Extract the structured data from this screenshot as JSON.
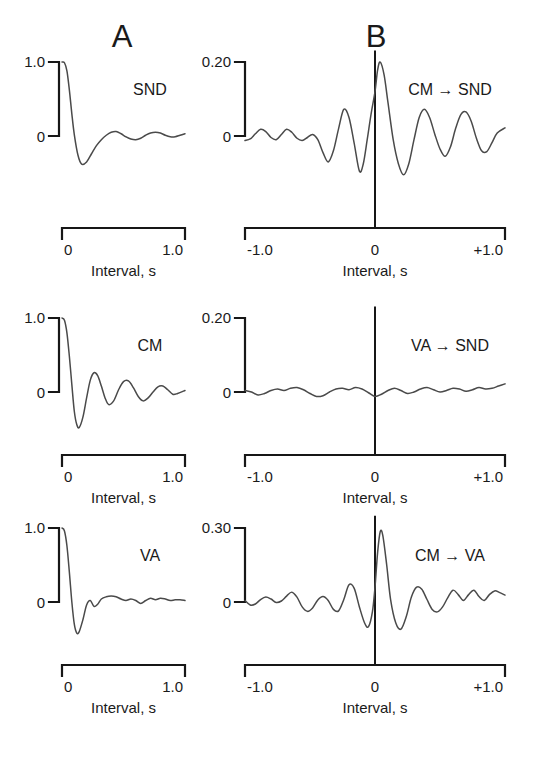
{
  "figure": {
    "panel_letters": [
      {
        "label": "A",
        "x": 122,
        "y": 47
      },
      {
        "label": "B",
        "x": 376,
        "y": 47
      }
    ]
  },
  "chart_data": [
    {
      "id": "snd-auto",
      "type": "line",
      "title": "",
      "series_label": "SND",
      "column": "A",
      "row": 0,
      "xlabel": "Interval, s",
      "ylabel": "",
      "xticks": [
        "0",
        "1.0"
      ],
      "xlim": [
        0,
        1.0
      ],
      "yticks": [
        "0",
        "1.0"
      ],
      "ylim": [
        -0.45,
        1.0
      ],
      "grid": false,
      "x": [
        0.0,
        0.02,
        0.04,
        0.06,
        0.08,
        0.1,
        0.13,
        0.16,
        0.2,
        0.24,
        0.28,
        0.32,
        0.36,
        0.4,
        0.44,
        0.48,
        0.52,
        0.56,
        0.6,
        0.64,
        0.68,
        0.72,
        0.76,
        0.8,
        0.84,
        0.88,
        0.92,
        0.96,
        1.0
      ],
      "y": [
        1.0,
        0.99,
        0.88,
        0.62,
        0.3,
        0.02,
        -0.26,
        -0.38,
        -0.35,
        -0.24,
        -0.13,
        -0.05,
        0.01,
        0.05,
        0.06,
        0.03,
        -0.01,
        -0.04,
        -0.05,
        -0.03,
        0.01,
        0.04,
        0.05,
        0.04,
        0.01,
        -0.01,
        -0.01,
        0.01,
        0.03
      ]
    },
    {
      "id": "cm-snd-cross",
      "type": "line",
      "title": "",
      "series_label": "CM → SND",
      "column": "B",
      "row": 0,
      "xlabel": "Interval, s",
      "ylabel": "",
      "xticks": [
        "-1.0",
        "0",
        "+1.0"
      ],
      "xlim": [
        -1.0,
        1.0
      ],
      "yticks": [
        "0",
        "0.20"
      ],
      "ylim": [
        -0.13,
        0.215
      ],
      "grid": false,
      "zero_line": true,
      "x": [
        -1.0,
        -0.96,
        -0.92,
        -0.88,
        -0.84,
        -0.8,
        -0.76,
        -0.72,
        -0.68,
        -0.64,
        -0.6,
        -0.56,
        -0.52,
        -0.48,
        -0.44,
        -0.4,
        -0.36,
        -0.32,
        -0.28,
        -0.24,
        -0.2,
        -0.16,
        -0.12,
        -0.09,
        -0.06,
        -0.03,
        0.0,
        0.02,
        0.04,
        0.07,
        0.1,
        0.14,
        0.18,
        0.22,
        0.26,
        0.3,
        0.34,
        0.38,
        0.42,
        0.46,
        0.5,
        0.54,
        0.58,
        0.62,
        0.66,
        0.7,
        0.74,
        0.78,
        0.82,
        0.86,
        0.9,
        0.94,
        1.0
      ],
      "y": [
        -0.012,
        -0.008,
        0.006,
        0.018,
        0.012,
        -0.004,
        -0.01,
        0.004,
        0.018,
        0.01,
        -0.006,
        -0.012,
        -0.004,
        0.004,
        -0.01,
        -0.045,
        -0.07,
        -0.04,
        0.02,
        0.072,
        0.05,
        -0.02,
        -0.095,
        -0.075,
        -0.01,
        0.06,
        0.12,
        0.178,
        0.2,
        0.165,
        0.09,
        -0.01,
        -0.075,
        -0.105,
        -0.075,
        -0.01,
        0.05,
        0.072,
        0.05,
        0.005,
        -0.035,
        -0.055,
        -0.03,
        0.02,
        0.058,
        0.065,
        0.04,
        -0.006,
        -0.04,
        -0.042,
        -0.018,
        0.008,
        0.022
      ]
    },
    {
      "id": "cm-auto",
      "type": "line",
      "title": "",
      "series_label": "CM",
      "column": "A",
      "row": 1,
      "xlabel": "Interval, s",
      "ylabel": "",
      "xticks": [
        "0",
        "1.0"
      ],
      "xlim": [
        0,
        1.0
      ],
      "yticks": [
        "0",
        "1.0"
      ],
      "ylim": [
        -0.52,
        1.0
      ],
      "grid": false,
      "x": [
        0.0,
        0.02,
        0.04,
        0.06,
        0.08,
        0.1,
        0.12,
        0.14,
        0.17,
        0.2,
        0.23,
        0.26,
        0.29,
        0.32,
        0.35,
        0.38,
        0.42,
        0.46,
        0.5,
        0.54,
        0.58,
        0.62,
        0.66,
        0.7,
        0.74,
        0.78,
        0.82,
        0.86,
        0.9,
        0.94,
        1.0
      ],
      "y": [
        1.0,
        0.97,
        0.8,
        0.48,
        0.1,
        -0.26,
        -0.44,
        -0.48,
        -0.34,
        -0.08,
        0.16,
        0.26,
        0.22,
        0.08,
        -0.08,
        -0.17,
        -0.12,
        0.03,
        0.14,
        0.15,
        0.06,
        -0.06,
        -0.12,
        -0.08,
        0.0,
        0.07,
        0.08,
        0.03,
        -0.03,
        -0.02,
        0.02
      ]
    },
    {
      "id": "va-snd-cross",
      "type": "line",
      "title": "",
      "series_label": "VA → SND",
      "column": "B",
      "row": 1,
      "xlabel": "Interval, s",
      "ylabel": "",
      "xticks": [
        "-1.0",
        "0",
        "+1.0"
      ],
      "xlim": [
        -1.0,
        1.0
      ],
      "yticks": [
        "0",
        "0.20"
      ],
      "ylim": [
        -0.06,
        0.215
      ],
      "grid": false,
      "zero_line": true,
      "x": [
        -1.0,
        -0.95,
        -0.9,
        -0.85,
        -0.8,
        -0.75,
        -0.7,
        -0.65,
        -0.6,
        -0.55,
        -0.5,
        -0.45,
        -0.4,
        -0.35,
        -0.3,
        -0.25,
        -0.2,
        -0.15,
        -0.1,
        -0.05,
        0.0,
        0.05,
        0.1,
        0.15,
        0.2,
        0.25,
        0.3,
        0.35,
        0.4,
        0.45,
        0.5,
        0.55,
        0.6,
        0.65,
        0.7,
        0.75,
        0.8,
        0.85,
        0.9,
        0.95,
        1.0
      ],
      "y": [
        0.004,
        0.0,
        -0.008,
        -0.004,
        0.004,
        0.008,
        0.004,
        0.01,
        0.012,
        0.006,
        -0.004,
        -0.012,
        -0.01,
        0.0,
        0.008,
        0.01,
        0.006,
        0.012,
        0.008,
        -0.002,
        -0.012,
        -0.006,
        0.004,
        0.01,
        0.004,
        -0.004,
        0.0,
        0.008,
        0.012,
        0.006,
        0.0,
        0.004,
        0.01,
        0.008,
        0.002,
        0.006,
        0.012,
        0.008,
        0.01,
        0.016,
        0.022
      ]
    },
    {
      "id": "va-auto",
      "type": "line",
      "title": "",
      "series_label": "VA",
      "column": "A",
      "row": 2,
      "xlabel": "Interval, s",
      "ylabel": "",
      "xticks": [
        "0",
        "1.0"
      ],
      "xlim": [
        0,
        1.0
      ],
      "yticks": [
        "0",
        "1.0"
      ],
      "ylim": [
        -0.48,
        1.0
      ],
      "grid": false,
      "x": [
        0.0,
        0.02,
        0.04,
        0.06,
        0.08,
        0.1,
        0.12,
        0.14,
        0.17,
        0.2,
        0.23,
        0.26,
        0.29,
        0.32,
        0.36,
        0.4,
        0.44,
        0.48,
        0.52,
        0.56,
        0.6,
        0.64,
        0.68,
        0.72,
        0.76,
        0.8,
        0.84,
        0.88,
        0.92,
        0.96,
        1.0
      ],
      "y": [
        1.0,
        0.96,
        0.76,
        0.4,
        0.0,
        -0.3,
        -0.42,
        -0.4,
        -0.24,
        -0.04,
        0.02,
        -0.06,
        -0.03,
        0.04,
        0.07,
        0.08,
        0.07,
        0.04,
        0.02,
        0.04,
        0.02,
        -0.02,
        0.02,
        0.05,
        0.03,
        0.05,
        0.04,
        0.02,
        0.03,
        0.03,
        0.02
      ]
    },
    {
      "id": "cm-va-cross",
      "type": "line",
      "title": "",
      "series_label": "CM → VA",
      "column": "B",
      "row": 2,
      "xlabel": "Interval, s",
      "ylabel": "",
      "xticks": [
        "-1.0",
        "0",
        "+1.0"
      ],
      "xlim": [
        -1.0,
        1.0
      ],
      "yticks": [
        "0",
        "0.30"
      ],
      "ylim": [
        -0.155,
        0.325
      ],
      "grid": false,
      "zero_line": true,
      "x": [
        -1.0,
        -0.96,
        -0.92,
        -0.88,
        -0.84,
        -0.8,
        -0.76,
        -0.72,
        -0.68,
        -0.64,
        -0.6,
        -0.56,
        -0.52,
        -0.48,
        -0.44,
        -0.4,
        -0.36,
        -0.32,
        -0.28,
        -0.24,
        -0.2,
        -0.16,
        -0.12,
        -0.08,
        -0.05,
        -0.02,
        0.0,
        0.02,
        0.04,
        0.06,
        0.09,
        0.12,
        0.16,
        0.2,
        0.24,
        0.28,
        0.32,
        0.36,
        0.4,
        0.44,
        0.48,
        0.52,
        0.56,
        0.6,
        0.64,
        0.68,
        0.72,
        0.76,
        0.8,
        0.84,
        0.88,
        0.92,
        0.96,
        1.0
      ],
      "y": [
        0.006,
        -0.012,
        -0.008,
        0.01,
        0.02,
        0.012,
        -0.002,
        0.004,
        0.024,
        0.04,
        0.02,
        -0.02,
        -0.038,
        -0.024,
        0.008,
        0.022,
        0.006,
        -0.03,
        -0.036,
        0.01,
        0.07,
        0.055,
        -0.02,
        -0.085,
        -0.1,
        -0.04,
        0.06,
        0.2,
        0.285,
        0.27,
        0.15,
        0.01,
        -0.085,
        -0.11,
        -0.06,
        0.02,
        0.06,
        0.052,
        0.01,
        -0.03,
        -0.04,
        -0.02,
        0.018,
        0.048,
        0.03,
        0.006,
        0.03,
        0.048,
        0.022,
        0.006,
        0.03,
        0.045,
        0.038,
        0.028
      ]
    }
  ]
}
